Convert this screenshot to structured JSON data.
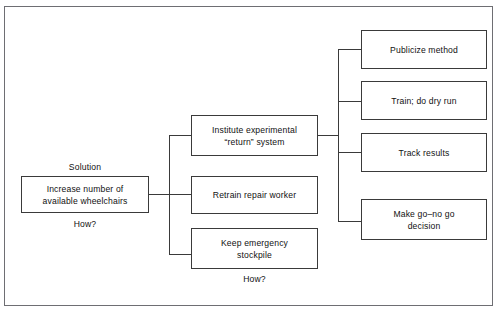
{
  "diagram": {
    "title_caption_left": "Solution",
    "how_caption_left": "How?",
    "how_caption_middle": "How?",
    "solution_box": {
      "line1": "Increase number of",
      "line2": "available wheelchairs"
    },
    "middle_boxes": [
      {
        "line1": "Institute experimental",
        "line2": "“return” system"
      },
      {
        "line1": "Retrain repair worker",
        "line2": ""
      },
      {
        "line1": "Keep emergency",
        "line2": "stockpile"
      }
    ],
    "right_boxes": [
      {
        "line1": "Publicize method",
        "line2": ""
      },
      {
        "line1": "Train; do dry run",
        "line2": ""
      },
      {
        "line1": "Track results",
        "line2": ""
      },
      {
        "line1": "Make go–no go",
        "line2": "decision"
      }
    ],
    "colors": {
      "box_border": "#3a3a3a",
      "frame_border": "#6e6e73",
      "connector": "#3a3a3a",
      "text": "#111111",
      "background": "#ffffff"
    }
  }
}
